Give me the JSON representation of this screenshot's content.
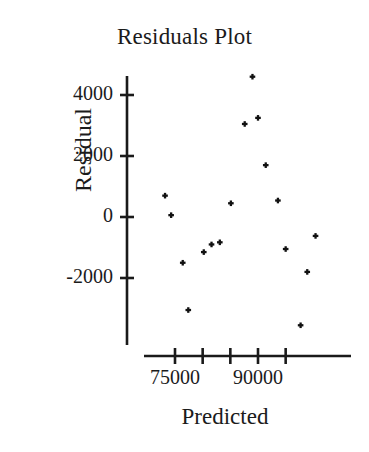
{
  "chart_data": {
    "type": "scatter",
    "title": "Residuals Plot",
    "xlabel": "Predicted",
    "ylabel": "Residual",
    "grid": false,
    "legend": null,
    "marker": "plus",
    "marker_color": "#111111",
    "background_color": "#ffffff",
    "axis_color": "#1a1a1a",
    "xlim": [
      70000,
      105000
    ],
    "ylim": [
      -4000,
      5000
    ],
    "x_ticks": [
      72500,
      75000,
      80000,
      85000,
      90000,
      95000,
      100000
    ],
    "x_tick_positions": [
      75000,
      80000,
      85000,
      90000,
      95000
    ],
    "x_tick_labels": [
      "75000",
      "",
      "90000",
      "",
      ""
    ],
    "x_labeled_ticks": [
      {
        "value": 75000,
        "label": "75000"
      },
      {
        "value": 90000,
        "label": "90000"
      }
    ],
    "y_ticks": [
      4000,
      2000,
      0,
      -2000
    ],
    "y_tick_labels": [
      "4000",
      "2000",
      "0",
      "-2000"
    ],
    "points": [
      {
        "x": 73200,
        "y": 700
      },
      {
        "x": 74300,
        "y": 60
      },
      {
        "x": 76400,
        "y": -1500
      },
      {
        "x": 77400,
        "y": -3050
      },
      {
        "x": 80200,
        "y": -1150
      },
      {
        "x": 81600,
        "y": -900
      },
      {
        "x": 83100,
        "y": -830
      },
      {
        "x": 85100,
        "y": 450
      },
      {
        "x": 87600,
        "y": 3050
      },
      {
        "x": 89000,
        "y": 4600
      },
      {
        "x": 90000,
        "y": 3250
      },
      {
        "x": 91400,
        "y": 1700
      },
      {
        "x": 93600,
        "y": 540
      },
      {
        "x": 95000,
        "y": -1050
      },
      {
        "x": 97700,
        "y": -3550
      },
      {
        "x": 98900,
        "y": -1800
      },
      {
        "x": 100400,
        "y": -620
      }
    ]
  }
}
